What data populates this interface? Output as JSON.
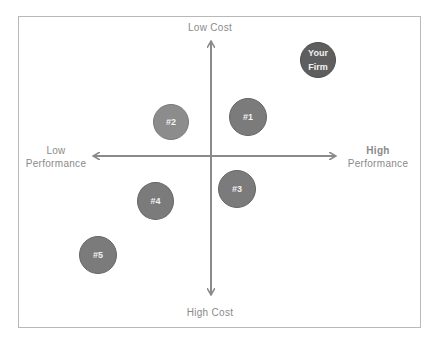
{
  "diagram": {
    "type": "positioning-map",
    "axes": {
      "top": "Low Cost",
      "bottom": "High Cost",
      "left": "Low\nPerformance",
      "right": "High\nPerformance",
      "left_line1": "Low",
      "left_line2": "Performance",
      "right_line1": "High",
      "right_line2": "Performance"
    },
    "bubbles": [
      {
        "id": "your-firm",
        "label": "Your\nFirm",
        "cx": 318,
        "cy": 60,
        "color": "#5e5e5e"
      },
      {
        "id": "2",
        "label": "#2",
        "cx": 171,
        "cy": 122,
        "color": "#8c8c8c"
      },
      {
        "id": "1",
        "label": "#1",
        "cx": 247,
        "cy": 117,
        "color": "#7b7b7b"
      },
      {
        "id": "3",
        "label": "#3",
        "cx": 237,
        "cy": 189,
        "color": "#7b7b7b"
      },
      {
        "id": "4",
        "label": "#4",
        "cx": 155,
        "cy": 201,
        "color": "#7b7b7b"
      },
      {
        "id": "5",
        "label": "#5",
        "cx": 98,
        "cy": 254,
        "color": "#7b7b7b"
      }
    ],
    "colors": {
      "axis": "#8a8a8a",
      "frame": "#b8b8b8",
      "label_text": "#8a8a8a",
      "bubble_text": "#f2f2f2"
    }
  }
}
